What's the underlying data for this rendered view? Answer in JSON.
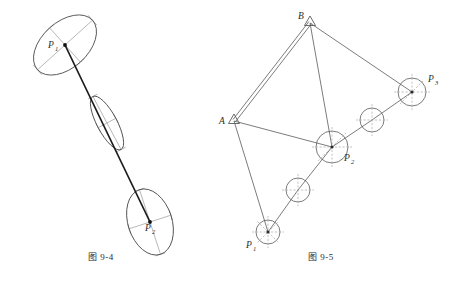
{
  "page": {
    "width": 456,
    "height": 291,
    "background": "#ffffff",
    "ink": "#2b2b2b",
    "ink_light": "#8c8c8c",
    "ink_mid": "#5a5a5a"
  },
  "figures": [
    {
      "id": "fig-9-4",
      "caption": "图 9-4",
      "type": "error-ellipse-diagram",
      "description": "Point position error ellipses along a traverse leg",
      "points": [
        {
          "name": "P",
          "subscript": "1",
          "label_x": 48,
          "label_y": 48,
          "cx": 65,
          "cy": 45,
          "marker": "dot"
        },
        {
          "name": "P",
          "subscript": "2",
          "label_x": 145,
          "label_y": 228,
          "cx": 150,
          "cy": 222,
          "marker": "dot"
        }
      ],
      "ellipses": [
        {
          "name": "ellipse-p1",
          "cx": 65,
          "cy": 45,
          "rx": 37,
          "ry": 23,
          "rotation": -42
        },
        {
          "name": "ellipse-middle",
          "cx": 107,
          "cy": 123,
          "rx": 30,
          "ry": 10,
          "rotation": 62
        },
        {
          "name": "ellipse-p2",
          "cx": 150,
          "cy": 222,
          "rx": 34,
          "ry": 22,
          "rotation": 72
        }
      ],
      "connector": {
        "name": "traverse-line",
        "x1": 65,
        "y1": 45,
        "x2": 150,
        "y2": 222
      }
    },
    {
      "id": "fig-9-5",
      "caption": "图 9-5",
      "type": "traverse-network-diagram",
      "description": "Traverse network with two control points and three new points",
      "control_points": [
        {
          "name": "A",
          "label_x": 221,
          "label_y": 121,
          "x": 234,
          "y": 121,
          "marker": "triangle"
        },
        {
          "name": "B",
          "label_x": 298,
          "label_y": 21,
          "x": 310,
          "y": 23,
          "marker": "triangle"
        }
      ],
      "new_points": [
        {
          "name": "P",
          "subscript": "1",
          "label_x": 248,
          "label_y": 245,
          "cx": 268,
          "cy": 232,
          "r": 12,
          "marker": "circle-crosshair"
        },
        {
          "name": "P",
          "subscript": "2",
          "label_x": 344,
          "label_y": 160,
          "cx": 332,
          "cy": 147,
          "r": 16,
          "marker": "circle-crosshair"
        },
        {
          "name": "P",
          "subscript": "3",
          "label_x": 428,
          "label_y": 82,
          "cx": 412,
          "cy": 92,
          "r": 14,
          "marker": "circle-crosshair"
        }
      ],
      "intermediate_points": [
        {
          "name": "mid-1",
          "cx": 298,
          "cy": 190,
          "r": 12,
          "marker": "circle-crosshair"
        },
        {
          "name": "mid-2",
          "cx": 372,
          "cy": 120,
          "r": 12,
          "marker": "circle-crosshair"
        }
      ],
      "baseline": {
        "name": "baseline-AB",
        "x1": 234,
        "y1": 121,
        "x2": 310,
        "y2": 23,
        "style": "double"
      },
      "sight_lines": [
        {
          "name": "line-B-P2",
          "x1": 310,
          "y1": 23,
          "x2": 332,
          "y2": 147
        },
        {
          "name": "line-B-P3",
          "x1": 310,
          "y1": 23,
          "x2": 412,
          "y2": 92
        },
        {
          "name": "line-A-P2",
          "x1": 234,
          "y1": 121,
          "x2": 332,
          "y2": 147
        },
        {
          "name": "line-A-P1",
          "x1": 234,
          "y1": 121,
          "x2": 268,
          "y2": 232
        }
      ],
      "traverse_chain": [
        {
          "name": "chain-P1-mid1",
          "x1": 268,
          "y1": 232,
          "x2": 298,
          "y2": 190
        },
        {
          "name": "chain-mid1-P2",
          "x1": 298,
          "y1": 190,
          "x2": 332,
          "y2": 147
        },
        {
          "name": "chain-P2-mid2",
          "x1": 332,
          "y1": 147,
          "x2": 372,
          "y2": 120
        },
        {
          "name": "chain-mid2-P3",
          "x1": 372,
          "y1": 120,
          "x2": 412,
          "y2": 92
        }
      ]
    }
  ]
}
